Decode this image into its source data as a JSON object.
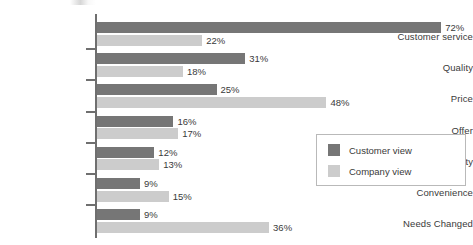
{
  "chart_data": {
    "type": "bar",
    "orientation": "horizontal",
    "title": "",
    "xlabel": "",
    "ylabel": "",
    "xlim": [
      0,
      80
    ],
    "grid": false,
    "value_suffix": "%",
    "legend_position": "right-middle",
    "categories": [
      "Customer service",
      "Quality",
      "Price",
      "Offer",
      "Functionality",
      "Convenience",
      "Needs Changed"
    ],
    "series": [
      {
        "name": "Customer view",
        "color": "#767676",
        "values": [
          72,
          31,
          25,
          16,
          12,
          9,
          9
        ],
        "labels": [
          "72%",
          "31%",
          "25%",
          "16%",
          "12%",
          "9%",
          "9%"
        ]
      },
      {
        "name": "Company view",
        "color": "#cccccc",
        "values": [
          22,
          18,
          48,
          17,
          13,
          15,
          36
        ],
        "labels": [
          "22%",
          "18%",
          "48%",
          "17%",
          "13%",
          "15%",
          "36%"
        ]
      }
    ]
  },
  "legend": {
    "entries": [
      {
        "label": "Customer view",
        "color": "#767676"
      },
      {
        "label": "Company view",
        "color": "#cccccc"
      }
    ]
  }
}
